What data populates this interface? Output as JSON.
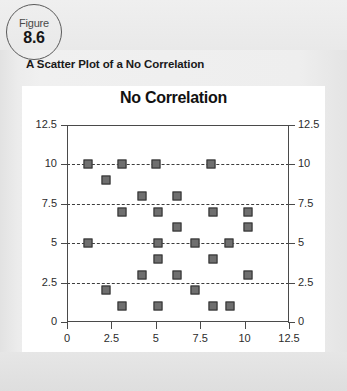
{
  "figure": {
    "word": "Figure",
    "number": "8.6"
  },
  "caption": "A Scatter Plot of a No Correlation",
  "chart_data": {
    "type": "scatter",
    "title": "No Correlation",
    "xlabel": "",
    "ylabel": "",
    "xlim": [
      0,
      12.5
    ],
    "ylim": [
      0,
      12.5
    ],
    "xticks": [
      "0",
      "2.5",
      "5",
      "7.5",
      "10",
      "12.5"
    ],
    "xtick_values": [
      0,
      2.5,
      5,
      7.5,
      10,
      12.5
    ],
    "yticks": [
      "0",
      "2.5",
      "5",
      "7.5",
      "10",
      "12.5"
    ],
    "ytick_values": [
      0,
      2.5,
      5,
      7.5,
      10,
      12.5
    ],
    "y_axis_right_mirrored": true,
    "grid": "horizontal-dashed",
    "gridlines_at": [
      2.5,
      5,
      7.5,
      10
    ],
    "legend": "none",
    "marker": "square",
    "marker_color": "#6f6f6f",
    "marker_edge_color": "#2f2f2f",
    "points": [
      {
        "x": 1.2,
        "y": 10
      },
      {
        "x": 3.1,
        "y": 10
      },
      {
        "x": 5.0,
        "y": 10
      },
      {
        "x": 8.1,
        "y": 10
      },
      {
        "x": 2.2,
        "y": 9
      },
      {
        "x": 4.2,
        "y": 8
      },
      {
        "x": 6.2,
        "y": 8
      },
      {
        "x": 3.1,
        "y": 7
      },
      {
        "x": 5.1,
        "y": 7
      },
      {
        "x": 8.2,
        "y": 7
      },
      {
        "x": 10.2,
        "y": 7
      },
      {
        "x": 6.2,
        "y": 6
      },
      {
        "x": 10.2,
        "y": 6
      },
      {
        "x": 1.2,
        "y": 5
      },
      {
        "x": 5.1,
        "y": 5
      },
      {
        "x": 7.2,
        "y": 5
      },
      {
        "x": 9.1,
        "y": 5
      },
      {
        "x": 5.1,
        "y": 4
      },
      {
        "x": 8.2,
        "y": 4
      },
      {
        "x": 4.2,
        "y": 3
      },
      {
        "x": 6.2,
        "y": 3
      },
      {
        "x": 10.2,
        "y": 3
      },
      {
        "x": 2.2,
        "y": 2
      },
      {
        "x": 7.2,
        "y": 2
      },
      {
        "x": 3.1,
        "y": 1
      },
      {
        "x": 5.1,
        "y": 1
      },
      {
        "x": 8.2,
        "y": 1
      },
      {
        "x": 9.2,
        "y": 1
      }
    ]
  }
}
